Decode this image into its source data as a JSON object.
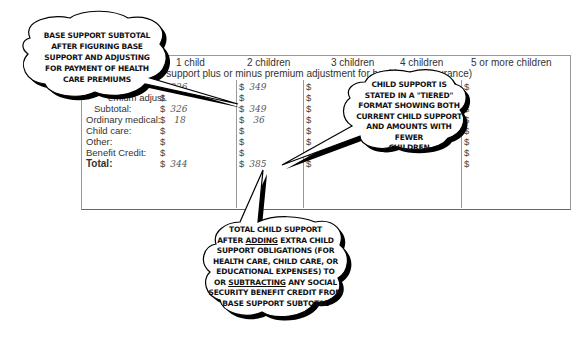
{
  "table": {
    "header_label": "ed:",
    "columns": [
      "1 child",
      "2 children",
      "3 children",
      "4 children",
      "5 or more children"
    ],
    "subtitle": "e support plus or minus premium adjustment for health-care insurance)",
    "rows": [
      {
        "label": "",
        "values": [
          "326",
          "349",
          "",
          "",
          ""
        ]
      },
      {
        "label": "emium adjust.",
        "values": [
          "",
          "",
          "",
          "",
          ""
        ]
      },
      {
        "label": "Subtotal:",
        "values": [
          "326",
          "349",
          "",
          "",
          ""
        ]
      },
      {
        "label": "Ordinary medical:",
        "values": [
          "18",
          "36",
          "",
          "",
          ""
        ]
      },
      {
        "label": "Child care:",
        "values": [
          "",
          "",
          "",
          "",
          ""
        ]
      },
      {
        "label": "Other:",
        "values": [
          "",
          "",
          "",
          "",
          ""
        ]
      },
      {
        "label": "Benefit Credit:",
        "values": [
          "",
          "",
          "",
          "",
          ""
        ]
      },
      {
        "label": "Total:",
        "values": [
          "344",
          "385",
          "",
          "",
          ""
        ]
      }
    ],
    "currency": "$"
  },
  "callouts": {
    "base_support": {
      "lines": [
        "BASE SUPPORT SUBTOTAL",
        "AFTER FIGURING BASE",
        "SUPPORT AND ADJUSTING",
        "FOR PAYMENT OF HEALTH",
        "CARE PREMIUMS"
      ]
    },
    "tiered": {
      "lines": [
        "CHILD SUPPORT IS",
        "STATED IN A \"TIERED\"",
        "FORMAT SHOWING BOTH",
        "CURRENT CHILD SUPPORT",
        "AND AMOUNTS WITH FEWER",
        "CHILDREN"
      ]
    },
    "total": {
      "line1": "TOTAL CHILD SUPPORT",
      "line2_pre": "AFTER ",
      "line2_u": "ADDING",
      "line2_post": " EXTRA CHILD",
      "line3": "SUPPORT OBLIGATIONS (FOR",
      "line4": "HEALTH CARE, CHILD CARE, OR",
      "line5": "EDUCATIONAL EXPENSES) TO",
      "line6_pre": "OR ",
      "line6_u": "SUBTRACTING",
      "line6_post": " ANY SOCIAL",
      "line7": "SECURITY BENEFIT CREDIT FROM",
      "line8": "BASE SUPPORT SUBTOTAL"
    }
  }
}
